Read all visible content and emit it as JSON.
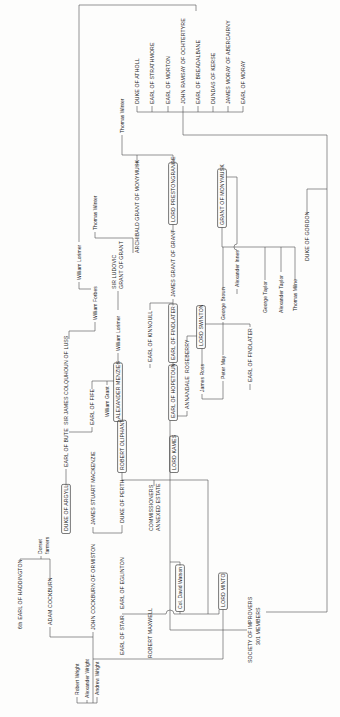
{
  "diagram": {
    "orientation": "rotated-90-ccw",
    "colors": {
      "background": "#fdfdfc",
      "line": "#4d4d4d",
      "text": "#1c1c1c",
      "box_stroke": "#3f3f3f"
    },
    "logical_canvas": {
      "width": 717,
      "height": 340
    },
    "viewport": {
      "width": 340,
      "height": 717
    }
  },
  "nodes": [
    {
      "id": "haddington",
      "label": "6th EARL OF HADDINGTON",
      "x": 88,
      "y": 20,
      "style": "caps",
      "boxed": false
    },
    {
      "id": "dorset-farmers",
      "label": "Dorset",
      "label2": "farmers",
      "x": 163,
      "y": 40,
      "x2": 163,
      "y2": 47,
      "style": "name",
      "boxed": false
    },
    {
      "id": "adam-cockburn",
      "label": "ADAM COCKBURN",
      "x": 92,
      "y": 50,
      "style": "caps",
      "boxed": false
    },
    {
      "id": "robert-wright",
      "label": "Robert Wright",
      "x": 22,
      "y": 77,
      "style": "name",
      "boxed": false
    },
    {
      "id": "alexander-wright",
      "label": "Alexander Wright",
      "x": 19,
      "y": 87,
      "style": "name",
      "boxed": false
    },
    {
      "id": "andrew-wright",
      "label": "Andrew Wright",
      "x": 22,
      "y": 97,
      "style": "name",
      "boxed": false
    },
    {
      "id": "john-cockburn-of-ormiston",
      "label": "JOHN COCKBURN OF ORMISTON",
      "x": 87,
      "y": 93,
      "style": "caps",
      "boxed": false
    },
    {
      "id": "earl-of-stair",
      "label": "EARL OF STAIR",
      "x": 62,
      "y": 122,
      "style": "caps",
      "boxed": false
    },
    {
      "id": "earl-of-eglinton",
      "label": "EARL OF EGLINTON",
      "x": 108,
      "y": 122,
      "style": "caps",
      "boxed": false
    },
    {
      "id": "robert-maxwell",
      "label": "ROBERT MAXWELL",
      "x": 59,
      "y": 150,
      "style": "caps",
      "boxed": false
    },
    {
      "id": "col-david-watson",
      "label": "Col. David Watson",
      "x": 108,
      "y": 180,
      "style": "name",
      "boxed": true
    },
    {
      "id": "lord-minto",
      "label": "LORD MINTO",
      "x": 110,
      "y": 223,
      "style": "caps",
      "boxed": true
    },
    {
      "id": "society-of-improvers",
      "label": "SOCIETY OF IMPROVERS",
      "label2": "301 MEMBERS",
      "x": 54,
      "y": 250,
      "x2": 72,
      "y2": 258,
      "style": "caps",
      "boxed": false
    },
    {
      "id": "duke-of-argyll",
      "label": "DUKE OF ARGYLL",
      "x": 186,
      "y": 66,
      "style": "caps",
      "boxed": true
    },
    {
      "id": "james-stuart-mackenzie",
      "label": "JAMES STUART MACKENZIE",
      "x": 192,
      "y": 93,
      "style": "caps",
      "boxed": false
    },
    {
      "id": "earl-of-bute",
      "label": "EARL OF BUTE",
      "x": 250,
      "y": 66,
      "style": "caps",
      "boxed": false
    },
    {
      "id": "duke-of-perth",
      "label": "DUKE OF PERTH",
      "x": 194,
      "y": 122,
      "style": "caps",
      "boxed": false
    },
    {
      "id": "commissioners-annexed-estate",
      "label": "COMMISSIONERS",
      "label2": "ANNEXED ESTATE",
      "x": 186,
      "y": 151,
      "x2": 186,
      "y2": 158,
      "style": "caps",
      "boxed": false
    },
    {
      "id": "robert-oliphant",
      "label": "ROBERT OLIPHANT",
      "x": 247,
      "y": 122,
      "style": "caps",
      "boxed": true
    },
    {
      "id": "lord-kames",
      "label": "LORD KAMES",
      "x": 247,
      "y": 174,
      "style": "caps",
      "boxed": true
    },
    {
      "id": "sir-james-colquhoun-of-luss",
      "label": "SIR JAMES COLQUHOUN OF LUSS",
      "x": 292,
      "y": 66,
      "style": "caps",
      "boxed": false
    },
    {
      "id": "earl-of-fife",
      "label": "EARL OF FIFE",
      "x": 292,
      "y": 92,
      "style": "caps",
      "boxed": false
    },
    {
      "id": "william-grant",
      "label": "William Grant",
      "x": 300,
      "y": 107,
      "style": "name",
      "boxed": false
    },
    {
      "id": "alexander-menzies",
      "label": "ALEXANDER MENZIES",
      "x": 298,
      "y": 118,
      "style": "caps",
      "boxed": true
    },
    {
      "id": "william-lorimer-2",
      "label": "William Lorimer",
      "x": 366,
      "y": 118,
      "style": "name",
      "boxed": false
    },
    {
      "id": "sir-ludovic-grant-of-grant",
      "label": "SIR LUDOVIC",
      "label2": "GRANT OF GRANT",
      "x": 428,
      "y": 114,
      "x2": 428,
      "y2": 121,
      "style": "caps",
      "boxed": false
    },
    {
      "id": "william-lorimer-1",
      "label": "William Lorimer",
      "x": 437,
      "y": 79,
      "style": "name",
      "boxed": false
    },
    {
      "id": "william-forbes",
      "label": "William Forbes",
      "x": 397,
      "y": 95,
      "style": "name",
      "boxed": false
    },
    {
      "id": "thomas-winter-2",
      "label": "Thomas Winter",
      "x": 487,
      "y": 95,
      "style": "name",
      "boxed": false
    },
    {
      "id": "earl-of-kinnoull",
      "label": "EARL OF KINNOULL",
      "x": 355,
      "y": 150,
      "style": "caps",
      "boxed": false
    },
    {
      "id": "earl-of-hopetoun",
      "label": "EARL OF HOPETOUN",
      "x": 299,
      "y": 173,
      "style": "caps",
      "boxed": true
    },
    {
      "id": "earl-of-findlater-1",
      "label": "EARL OF FINDLATER",
      "x": 357,
      "y": 173,
      "style": "caps",
      "boxed": true
    },
    {
      "id": "annandale",
      "label": "ANNANDALE",
      "x": 308,
      "y": 187,
      "style": "caps",
      "boxed": false
    },
    {
      "id": "roseberry",
      "label": "ROSEBERRY",
      "x": 344,
      "y": 187,
      "style": "caps",
      "boxed": false
    },
    {
      "id": "james-ross",
      "label": "James Ross",
      "x": 325,
      "y": 202,
      "style": "name",
      "boxed": false
    },
    {
      "id": "lord-swinton",
      "label": "LORD SWINTON",
      "x": 371,
      "y": 201,
      "style": "caps",
      "boxed": true
    },
    {
      "id": "peter-may",
      "label": "Peter May",
      "x": 338,
      "y": 223,
      "style": "name",
      "boxed": false
    },
    {
      "id": "george-brown",
      "label": "George Brown",
      "x": 397,
      "y": 223,
      "style": "name",
      "boxed": false
    },
    {
      "id": "earl-of-findlater-2",
      "label": "EARL OF FINDLATER",
      "x": 335,
      "y": 250,
      "style": "caps",
      "boxed": false
    },
    {
      "id": "george-taylor",
      "label": "George Taylor",
      "x": 404,
      "y": 265,
      "style": "name",
      "boxed": false
    },
    {
      "id": "alexander-taylor",
      "label": "Alexander Taylor",
      "x": 404,
      "y": 281,
      "style": "name",
      "boxed": false
    },
    {
      "id": "thomas-milne",
      "label": "Thomas Milne",
      "x": 406,
      "y": 295,
      "style": "name",
      "boxed": false
    },
    {
      "id": "alexander-innes",
      "label": "Alexander Innes",
      "x": 430,
      "y": 237,
      "style": "name",
      "boxed": false
    },
    {
      "id": "duke-of-gordon",
      "label": "DUKE OF GORDON",
      "x": 456,
      "y": 307,
      "style": "caps",
      "boxed": false
    },
    {
      "id": "archibald-grant-of-monymusk",
      "label": "ARCHIBALD GRANT OF MONYMUSK",
      "x": 464,
      "y": 137,
      "style": "caps",
      "boxed": false
    },
    {
      "id": "thomas-winter-1",
      "label": "Thomas Winter",
      "x": 584,
      "y": 122,
      "style": "name",
      "boxed": false
    },
    {
      "id": "james-grant-of-grant",
      "label": "JAMES GRANT OF GRANT",
      "x": 420,
      "y": 173,
      "style": "caps",
      "boxed": false
    },
    {
      "id": "lord-prestongrange",
      "label": "LORD PRESTONGRANGE",
      "x": 495,
      "y": 173,
      "style": "caps",
      "boxed": true
    },
    {
      "id": "grant-of-monymusk",
      "label": "GRANT OF MONYMUSK",
      "x": 492,
      "y": 222,
      "style": "caps",
      "boxed": true
    },
    {
      "id": "duke-of-atholl",
      "label": "DUKE OF ATHOLL",
      "x": 613,
      "y": 137,
      "style": "caps",
      "boxed": false
    },
    {
      "id": "earl-of-strathmore",
      "label": "EARL OF STRATHMORE",
      "x": 613,
      "y": 152,
      "style": "caps",
      "boxed": false
    },
    {
      "id": "earl-of-morton",
      "label": "EARL OF MORTON",
      "x": 613,
      "y": 168,
      "style": "caps",
      "boxed": false
    },
    {
      "id": "john-ramsay-of-ochtertyre",
      "label": "JOHN RAMSAY OF OCHTERTYRE",
      "x": 613,
      "y": 183,
      "style": "caps",
      "boxed": false
    },
    {
      "id": "earl-of-breadalbane",
      "label": "EARL OF BREADALBANE",
      "x": 613,
      "y": 198,
      "style": "caps",
      "boxed": false
    },
    {
      "id": "dundas-of-kerse",
      "label": "DUNDAS OF KERSE",
      "x": 613,
      "y": 213,
      "style": "caps",
      "boxed": false
    },
    {
      "id": "james-moray-of-abercairny",
      "label": "JAMES MORAY OF ABERCAIRNY",
      "x": 613,
      "y": 228,
      "style": "caps",
      "boxed": false
    },
    {
      "id": "earl-of-moray",
      "label": "EARL OF MORAY",
      "x": 613,
      "y": 243,
      "style": "caps",
      "boxed": false
    }
  ],
  "edges": [
    "M156 20 H158 V50 H136",
    "M158 41 H161",
    "M90 50 H80 V93",
    "M14 93 H85",
    "M14 77 V97",
    "M20 77 H14",
    "M17 87 H14",
    "M20 97 H14",
    "M58 93 V223",
    "M58 223 H107.5",
    "M87 170 V247",
    "M87 170 H296.5",
    "M103 122 V166 A4 4 0 0 1 103 174 V219 H107.5",
    "M103 180 H105.5",
    "M151.5 180 H155 V170",
    "M237 122 V208 H103",
    "M236 122 H244.5",
    "M231 154 H237",
    "M190 93 H184 V122 H192",
    "M231.5 66 H248",
    "M290 92 H285 V69",
    "M328 92 H336 V113.8",
    "M332 107 H336",
    "M352.5 118 H364",
    "M407 118 H426",
    "M395 95 H386 V69 H378",
    "M435 79 H428 V91",
    "M485 95 H479 V133 H464",
    "M475 79 H712 V196 H706",
    "M550 137 H562",
    "M582 122 H562",
    "M562 122 V173 H553.5",
    "M484 173 H492.5",
    "M411.5 173 H418",
    "M350.5 173 H354.5",
    "M407 150 H414 V173",
    "M353 150 H349",
    "M306 187 H301 V177.2",
    "M376 187 H381 V196.8",
    "M351 202 H368.5",
    "M323 202 H318 V223 H336",
    "M362 223 H395",
    "M428 223 H470",
    "M470 222 V295",
    "M470 222 H489.5",
    "M437 265 H470",
    "M445 281 H470",
    "M437 295 H470",
    "M428 237 H423",
    "M466 237 H467 A3 3 0 0 1 473 237 H540 V226.3",
    "M333 250 H327",
    "M390 250 H393 V205.3",
    "M502 307 H528 V327",
    "M105 327 H582 V183 H605",
    "M105 327 V266",
    "M605 137 V243",
    "M605 137 H611",
    "M605 152 H611",
    "M605 168 H611",
    "M605 183 H611",
    "M605 198 H611",
    "M605 213 H611",
    "M605 228 H611",
    "M605 243 H611"
  ]
}
